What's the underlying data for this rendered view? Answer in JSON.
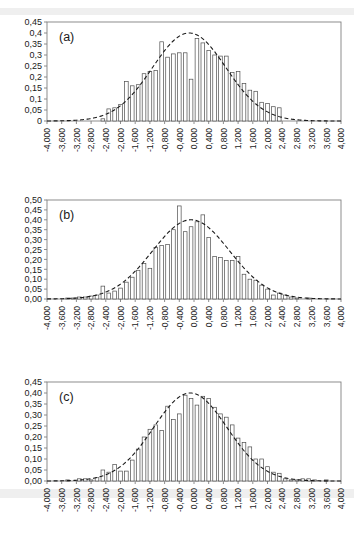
{
  "figure": {
    "type": "multi-panel-histogram",
    "panel_count": 3,
    "decimal_separator": "comma",
    "background": "#ffffff",
    "bar_fill": "#ffffff",
    "bar_stroke": "#4d4d4d",
    "curve_stroke": "#1a1a1a",
    "axis_stroke": "#808080"
  },
  "chart_data": [
    {
      "id": "a",
      "type": "bar",
      "title": "(a)",
      "xlabel": "",
      "ylabel": "",
      "grid": false,
      "legend": false,
      "xlim": [
        -4.0,
        4.0
      ],
      "ylim": [
        0.0,
        0.45
      ],
      "ytick_labels": [
        "0,45",
        "0,4",
        "0,35",
        "0,3",
        "0,25",
        "0,2",
        "0,15",
        "0,1",
        "0,05",
        "0"
      ],
      "ytick_values": [
        0.45,
        0.4,
        0.35,
        0.3,
        0.25,
        0.2,
        0.15,
        0.1,
        0.05,
        0.0
      ],
      "xtick_labels": [
        "-4,000",
        "-3,600",
        "-3,200",
        "-2,800",
        "-2,400",
        "-2,000",
        "-1,600",
        "-1,200",
        "-0,800",
        "-0,400",
        "0,000",
        "0,400",
        "0,800",
        "1,200",
        "1,600",
        "2,000",
        "2,400",
        "2,800",
        "3,200",
        "3,600",
        "4,000"
      ],
      "xtick_values": [
        -4.0,
        -3.6,
        -3.2,
        -2.8,
        -2.4,
        -2.0,
        -1.6,
        -1.2,
        -0.8,
        -0.4,
        0.0,
        0.4,
        0.8,
        1.2,
        1.6,
        2.0,
        2.4,
        2.8,
        3.2,
        3.6,
        4.0
      ],
      "bin_width": 0.16,
      "categories": [
        -3.92,
        -3.76,
        -3.6,
        -3.44,
        -3.28,
        -3.12,
        -2.96,
        -2.8,
        -2.64,
        -2.48,
        -2.32,
        -2.16,
        -2.0,
        -1.84,
        -1.68,
        -1.52,
        -1.36,
        -1.2,
        -1.04,
        -0.88,
        -0.72,
        -0.56,
        -0.4,
        -0.24,
        -0.08,
        0.08,
        0.24,
        0.4,
        0.56,
        0.72,
        0.88,
        1.04,
        1.2,
        1.36,
        1.52,
        1.68,
        1.84,
        2.0,
        2.16,
        2.32,
        2.48,
        2.64,
        2.8,
        2.96,
        3.12,
        3.28,
        3.44,
        3.6,
        3.76,
        3.92
      ],
      "values": [
        0.0,
        0.0,
        0.0,
        0.0,
        0.0,
        0.0,
        0.0,
        0.0,
        0.0,
        0.01,
        0.055,
        0.06,
        0.075,
        0.18,
        0.16,
        0.165,
        0.215,
        0.225,
        0.23,
        0.36,
        0.29,
        0.305,
        0.31,
        0.31,
        0.19,
        0.375,
        0.355,
        0.32,
        0.3,
        0.295,
        0.295,
        0.22,
        0.225,
        0.17,
        0.14,
        0.135,
        0.085,
        0.08,
        0.065,
        0.06,
        0.0,
        0.0,
        0.0,
        0.0,
        0.0,
        0.0,
        0.0,
        0.0,
        0.0,
        0.0
      ],
      "overlay_curve": {
        "name": "normal",
        "mean": -0.13,
        "sigma": 1.0,
        "peak": 0.4,
        "style": "dashed"
      }
    },
    {
      "id": "b",
      "type": "bar",
      "title": "(b)",
      "xlabel": "",
      "ylabel": "",
      "grid": false,
      "legend": false,
      "xlim": [
        -4.0,
        4.0
      ],
      "ylim": [
        0.0,
        0.5
      ],
      "ytick_labels": [
        "0,50",
        "0,45",
        "0,40",
        "0,35",
        "0,30",
        "0,25",
        "0,20",
        "0,15",
        "0,10",
        "0,05",
        "0,00"
      ],
      "ytick_values": [
        0.5,
        0.45,
        0.4,
        0.35,
        0.3,
        0.25,
        0.2,
        0.15,
        0.1,
        0.05,
        0.0
      ],
      "xtick_labels": [
        "-4,000",
        "-3,600",
        "-3,200",
        "-2,800",
        "-2,400",
        "-2,000",
        "-1,600",
        "-1,200",
        "-0,800",
        "-0,400",
        "0,000",
        "0,400",
        "0,800",
        "1,200",
        "1,600",
        "2,000",
        "2,400",
        "2,800",
        "3,200",
        "3,600",
        "4,000"
      ],
      "xtick_values": [
        -4.0,
        -3.6,
        -3.2,
        -2.8,
        -2.4,
        -2.0,
        -1.6,
        -1.2,
        -0.8,
        -0.4,
        0.0,
        0.4,
        0.8,
        1.2,
        1.6,
        2.0,
        2.4,
        2.8,
        3.2,
        3.6,
        4.0
      ],
      "bin_width": 0.16,
      "categories": [
        -3.92,
        -3.76,
        -3.6,
        -3.44,
        -3.28,
        -3.12,
        -2.96,
        -2.8,
        -2.64,
        -2.48,
        -2.32,
        -2.16,
        -2.0,
        -1.84,
        -1.68,
        -1.52,
        -1.36,
        -1.2,
        -1.04,
        -0.88,
        -0.72,
        -0.56,
        -0.4,
        -0.24,
        -0.08,
        0.08,
        0.24,
        0.4,
        0.56,
        0.72,
        0.88,
        1.04,
        1.2,
        1.36,
        1.52,
        1.68,
        1.84,
        2.0,
        2.16,
        2.32,
        2.48,
        2.64,
        2.8,
        2.96,
        3.12,
        3.28,
        3.44,
        3.6,
        3.76,
        3.92
      ],
      "values": [
        0.0,
        0.0,
        0.0,
        0.005,
        0.005,
        0.01,
        0.01,
        0.015,
        0.02,
        0.065,
        0.03,
        0.04,
        0.055,
        0.085,
        0.11,
        0.145,
        0.18,
        0.155,
        0.26,
        0.27,
        0.275,
        0.35,
        0.47,
        0.34,
        0.365,
        0.39,
        0.425,
        0.31,
        0.215,
        0.21,
        0.195,
        0.195,
        0.215,
        0.125,
        0.1,
        0.095,
        0.07,
        0.05,
        0.02,
        0.03,
        0.02,
        0.01,
        0.005,
        0.0,
        0.005,
        0.0,
        0.0,
        0.0,
        0.0,
        0.0
      ],
      "overlay_curve": {
        "name": "normal",
        "mean": -0.08,
        "sigma": 1.05,
        "peak": 0.4,
        "style": "dashed"
      }
    },
    {
      "id": "c",
      "type": "bar",
      "title": "(c)",
      "xlabel": "",
      "ylabel": "",
      "grid": false,
      "legend": false,
      "xlim": [
        -4.0,
        4.0
      ],
      "ylim": [
        0.0,
        0.45
      ],
      "ytick_labels": [
        "0,45",
        "0,40",
        "0,35",
        "0,30",
        "0,25",
        "0,20",
        "0,15",
        "0,10",
        "0,05",
        "0,00"
      ],
      "ytick_values": [
        0.45,
        0.4,
        0.35,
        0.3,
        0.25,
        0.2,
        0.15,
        0.1,
        0.05,
        0.0
      ],
      "xtick_labels": [
        "-4,000",
        "-3,600",
        "-3,200",
        "-2,800",
        "-2,400",
        "-2,000",
        "-1,600",
        "-1,200",
        "-0,800",
        "-0,400",
        "0,000",
        "0,400",
        "0,800",
        "1,200",
        "1,600",
        "2,000",
        "2,400",
        "2,800",
        "3,200",
        "3,600",
        "4,000"
      ],
      "xtick_values": [
        -4.0,
        -3.6,
        -3.2,
        -2.8,
        -2.4,
        -2.0,
        -1.6,
        -1.2,
        -0.8,
        -0.4,
        0.0,
        0.4,
        0.8,
        1.2,
        1.6,
        2.0,
        2.4,
        2.8,
        3.2,
        3.6,
        4.0
      ],
      "bin_width": 0.16,
      "categories": [
        -3.92,
        -3.76,
        -3.6,
        -3.44,
        -3.28,
        -3.12,
        -2.96,
        -2.8,
        -2.64,
        -2.48,
        -2.32,
        -2.16,
        -2.0,
        -1.84,
        -1.68,
        -1.52,
        -1.36,
        -1.2,
        -1.04,
        -0.88,
        -0.72,
        -0.56,
        -0.4,
        -0.24,
        -0.08,
        0.08,
        0.24,
        0.4,
        0.56,
        0.72,
        0.88,
        1.04,
        1.2,
        1.36,
        1.52,
        1.68,
        1.84,
        2.0,
        2.16,
        2.32,
        2.48,
        2.64,
        2.8,
        2.96,
        3.12,
        3.28,
        3.44,
        3.6,
        3.76,
        3.92
      ],
      "values": [
        0.0,
        0.0,
        0.0,
        0.005,
        0.0,
        0.01,
        0.01,
        0.005,
        0.015,
        0.05,
        0.04,
        0.075,
        0.045,
        0.045,
        0.095,
        0.145,
        0.2,
        0.235,
        0.255,
        0.23,
        0.34,
        0.28,
        0.305,
        0.39,
        0.375,
        0.345,
        0.385,
        0.375,
        0.335,
        0.305,
        0.29,
        0.255,
        0.195,
        0.175,
        0.155,
        0.1,
        0.1,
        0.065,
        0.04,
        0.035,
        0.01,
        0.005,
        0.005,
        0.01,
        0.01,
        0.005,
        0.0,
        0.005,
        0.0,
        0.0
      ],
      "overlay_curve": {
        "name": "normal",
        "mean": -0.1,
        "sigma": 1.0,
        "peak": 0.4,
        "style": "dashed"
      }
    }
  ]
}
